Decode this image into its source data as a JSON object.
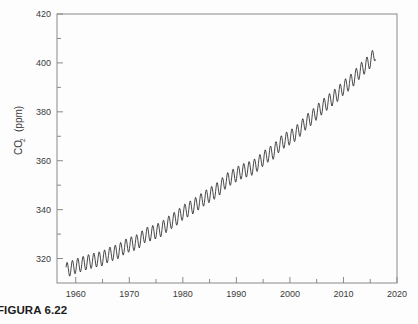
{
  "figure": {
    "caption": "FIGURA 6.22"
  },
  "chart_data": {
    "type": "line",
    "title": "",
    "xlabel": "",
    "ylabel": "CO",
    "ylabel_sub": "2",
    "ylabel_unit": "(ppm)",
    "xlim": [
      1956.5,
      2020
    ],
    "ylim": [
      310,
      420
    ],
    "grid": false,
    "legend": null,
    "x_major_ticks": [
      1960,
      1970,
      1980,
      1990,
      2000,
      2010,
      2020
    ],
    "x_major_labels": [
      "1960",
      "1970",
      "1980",
      "1990",
      "2000",
      "2010",
      "2020"
    ],
    "x_minor_ticks": [
      1965,
      1975,
      1985,
      1995,
      2005,
      2015
    ],
    "y_major_ticks": [
      320,
      340,
      360,
      380,
      400,
      420
    ],
    "y_major_labels": [
      "320",
      "340",
      "360",
      "380",
      "400",
      "420"
    ],
    "y_minor_ticks": [
      330,
      350,
      370,
      390,
      410
    ],
    "line_color": "#1a1a1a",
    "line_width": 0.8,
    "series": [
      {
        "name": "Mauna Loa atmospheric CO2",
        "description": "Monthly mean CO2 concentration with seasonal oscillation",
        "seasonal_amplitude_ppm": 6.0,
        "x": [
          1958.2,
          1959,
          1960,
          1961,
          1962,
          1963,
          1964,
          1965,
          1966,
          1967,
          1968,
          1969,
          1970,
          1971,
          1972,
          1973,
          1974,
          1975,
          1976,
          1977,
          1978,
          1979,
          1980,
          1981,
          1982,
          1983,
          1984,
          1985,
          1986,
          1987,
          1988,
          1989,
          1990,
          1991,
          1992,
          1993,
          1994,
          1995,
          1996,
          1997,
          1998,
          1999,
          2000,
          2001,
          2002,
          2003,
          2004,
          2005,
          2006,
          2007,
          2008,
          2009,
          2010,
          2011,
          2012,
          2013,
          2014,
          2015,
          2016
        ],
        "values": [
          315.3,
          315.9,
          316.9,
          317.6,
          318.4,
          319.0,
          319.6,
          320.0,
          321.4,
          322.2,
          323.0,
          324.6,
          325.7,
          326.3,
          327.5,
          329.7,
          330.2,
          331.1,
          332.0,
          333.8,
          335.4,
          336.8,
          338.8,
          340.1,
          341.4,
          343.0,
          344.6,
          346.0,
          347.4,
          349.2,
          351.6,
          353.1,
          354.4,
          355.6,
          356.4,
          357.1,
          358.8,
          360.8,
          362.6,
          363.7,
          366.6,
          368.3,
          369.5,
          371.0,
          373.2,
          375.8,
          377.5,
          379.8,
          381.9,
          383.8,
          385.6,
          387.4,
          389.9,
          391.6,
          393.8,
          396.5,
          398.6,
          400.8,
          404.2
        ]
      }
    ]
  }
}
